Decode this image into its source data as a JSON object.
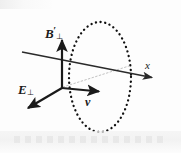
{
  "figure": {
    "width": 181,
    "height": 153,
    "background_color": "#fdfdfd",
    "stroke_color": "#1a1a1a",
    "faint_stroke_color": "#b9b9b9"
  },
  "labels": {
    "magnetic_field": {
      "symbol": "B",
      "prime": "′",
      "subscript": "⊥",
      "full_text": "B′⊥",
      "description": "perpendicular magnetic field primed"
    },
    "electric_field": {
      "symbol": "E",
      "prime": "",
      "subscript": "⊥",
      "full_text": "E⊥",
      "description": "perpendicular electric field"
    },
    "velocity": {
      "symbol": "v",
      "prime": "",
      "subscript": "",
      "full_text": "v",
      "description": "velocity vector"
    },
    "axis_x": {
      "symbol": "x",
      "prime": "",
      "subscript": "",
      "full_text": "x",
      "description": "x axis"
    }
  },
  "geometry": {
    "origin": {
      "x": 62,
      "y": 88
    },
    "ellipse": {
      "cx": 100,
      "cy": 77,
      "rx": 31,
      "ry": 55,
      "style": "dotted",
      "dot_color": "#111111",
      "dot_size": 2.1,
      "dot_gap": 4.6
    },
    "arrows": [
      {
        "name": "magnetic-field-arrow",
        "x1": 62,
        "y1": 88,
        "x2": 62,
        "y2": 37,
        "width": 2.1,
        "head": true,
        "color": "#1a1a1a"
      },
      {
        "name": "electric-field-arrow",
        "x1": 62,
        "y1": 88,
        "x2": 25,
        "y2": 110,
        "width": 2.1,
        "head": true,
        "color": "#1a1a1a"
      },
      {
        "name": "velocity-arrow",
        "x1": 62,
        "y1": 88,
        "x2": 103,
        "y2": 92,
        "width": 2.1,
        "head": true,
        "color": "#1a1a1a"
      },
      {
        "name": "x-axis-arrow",
        "x1": 22,
        "y1": 52,
        "x2": 155,
        "y2": 78,
        "width": 1.5,
        "head": true,
        "color": "#2a2a2a"
      }
    ],
    "guide_line": {
      "name": "radius-guide",
      "x1": 63,
      "y1": 87,
      "x2": 129,
      "y2": 66,
      "style": "dotted",
      "color": "#bdbdbd",
      "width": 1
    }
  }
}
